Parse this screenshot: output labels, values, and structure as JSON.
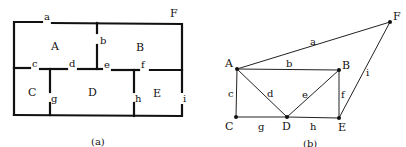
{
  "figure_a": {
    "caption": "(a)",
    "outside_label": "F",
    "rooms": [
      {
        "id": "A",
        "label": "A"
      },
      {
        "id": "B",
        "label": "B"
      },
      {
        "id": "C",
        "label": "C"
      },
      {
        "id": "D",
        "label": "D"
      },
      {
        "id": "E",
        "label": "E"
      }
    ],
    "doors": [
      {
        "id": "a",
        "label": "a"
      },
      {
        "id": "b",
        "label": "b"
      },
      {
        "id": "c",
        "label": "c"
      },
      {
        "id": "d",
        "label": "d"
      },
      {
        "id": "e",
        "label": "e"
      },
      {
        "id": "f",
        "label": "f"
      },
      {
        "id": "g",
        "label": "g"
      },
      {
        "id": "h",
        "label": "h"
      },
      {
        "id": "i",
        "label": "i"
      }
    ]
  },
  "figure_b": {
    "caption": "(b)",
    "vertices": [
      {
        "id": "A",
        "label": "A"
      },
      {
        "id": "B",
        "label": "B"
      },
      {
        "id": "C",
        "label": "C"
      },
      {
        "id": "D",
        "label": "D"
      },
      {
        "id": "E",
        "label": "E"
      },
      {
        "id": "F",
        "label": "F"
      }
    ],
    "edges": [
      {
        "id": "a",
        "label": "a",
        "from": "A",
        "to": "F"
      },
      {
        "id": "b",
        "label": "b",
        "from": "A",
        "to": "B"
      },
      {
        "id": "c",
        "label": "c",
        "from": "A",
        "to": "C"
      },
      {
        "id": "d",
        "label": "d",
        "from": "A",
        "to": "D"
      },
      {
        "id": "e",
        "label": "e",
        "from": "D",
        "to": "B"
      },
      {
        "id": "f",
        "label": "f",
        "from": "B",
        "to": "E"
      },
      {
        "id": "g",
        "label": "g",
        "from": "C",
        "to": "D"
      },
      {
        "id": "h",
        "label": "h",
        "from": "D",
        "to": "E"
      },
      {
        "id": "i",
        "label": "i",
        "from": "E",
        "to": "F"
      }
    ]
  }
}
